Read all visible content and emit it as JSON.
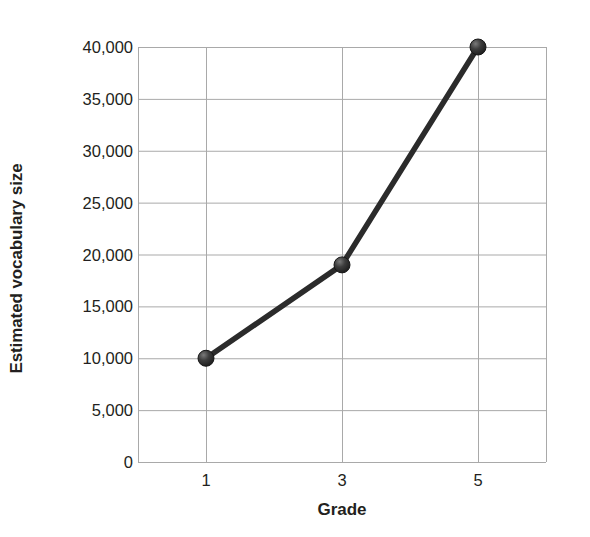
{
  "chart_data": {
    "type": "line",
    "title": "",
    "xlabel": "Grade",
    "ylabel": "Estimated vocabulary size",
    "x": [
      1,
      3,
      5
    ],
    "categories": [
      "1",
      "3",
      "5"
    ],
    "values": [
      10000,
      19000,
      40000
    ],
    "series": [
      {
        "name": "Estimated vocabulary size",
        "values": [
          10000,
          19000,
          40000
        ]
      }
    ],
    "xlim": [
      0,
      6
    ],
    "ylim": [
      0,
      40000
    ],
    "y_ticks": [
      0,
      5000,
      10000,
      15000,
      20000,
      25000,
      30000,
      35000,
      40000
    ],
    "y_tick_labels": [
      "0",
      "5,000",
      "10,000",
      "15,000",
      "20,000",
      "25,000",
      "30,000",
      "35,000",
      "40,000"
    ],
    "x_ticks": [
      1,
      3,
      5
    ],
    "x_tick_labels": [
      "1",
      "3",
      "5"
    ],
    "grid": "both",
    "legend": "none",
    "marker": "sphere",
    "line_color": "#2b2b2b",
    "marker_color": "#3a3a3a",
    "grid_color": "#a9a9a9",
    "background_color": "#ffffff",
    "text_color": "#231f20"
  },
  "axis": {
    "y_title": "Estimated vocabulary size",
    "x_title": "Grade"
  }
}
